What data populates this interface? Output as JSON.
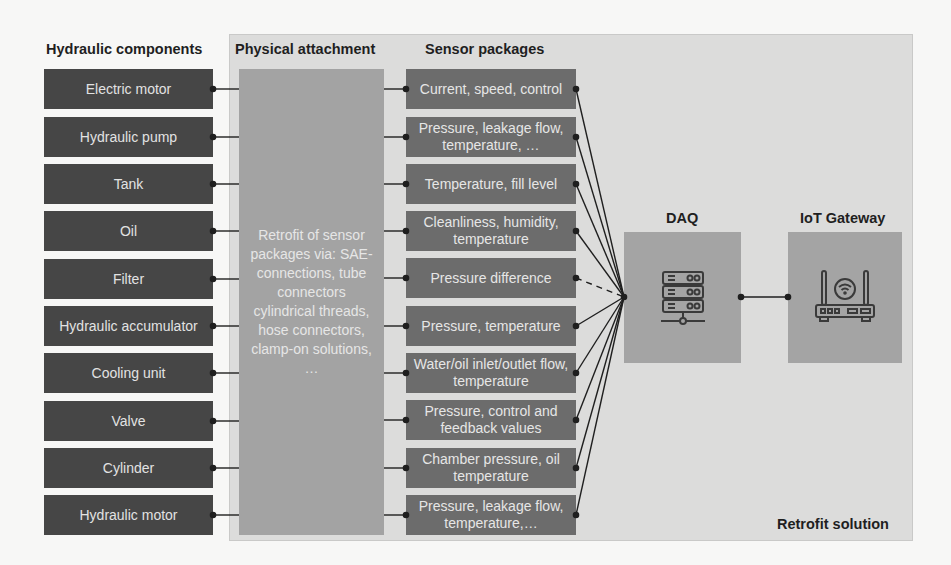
{
  "headings": {
    "components": "Hydraulic components",
    "attachment": "Physical attachment",
    "sensors": "Sensor packages",
    "daq": "DAQ",
    "gateway": "IoT Gateway",
    "retrofit": "Retrofit solution"
  },
  "components": [
    "Electric motor",
    "Hydraulic pump",
    "Tank",
    "Oil",
    "Filter",
    "Hydraulic accumulator",
    "Cooling unit",
    "Valve",
    "Cylinder",
    "Hydraulic motor"
  ],
  "attachment_text": "Retrofit of sensor packages via: SAE-connections, tube connectors cylindrical threads, hose connectors, clamp-on solutions, …",
  "sensors": [
    "Current, speed, control",
    "Pressure, leakage flow, temperature, …",
    "Temperature, fill level",
    "Cleanliness, humidity, temperature",
    "Pressure difference",
    "Pressure, temperature",
    "Water/oil inlet/outlet flow, temperature",
    "Pressure, control and feedback values",
    "Chamber pressure, oil temperature",
    "Pressure, leakage flow, temperature,…"
  ],
  "icons": {
    "daq": "server-rack-icon",
    "gateway": "wifi-router-icon"
  },
  "colors": {
    "component_box": "#464646",
    "sensor_box": "#6c6c6c",
    "attachment_box": "#a3a3a3",
    "panel": "#dcdcdb",
    "node_box": "#a4a4a4",
    "line": "#1f1f1f"
  }
}
